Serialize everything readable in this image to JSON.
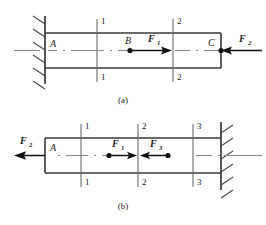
{
  "figure": {
    "colors": {
      "bar_edge": "#3a3a3a",
      "wall": "#3a3a3a",
      "hatch": "#4a4a4a",
      "section_line": "#6a6a6a",
      "center_line": "#8a8a8a",
      "force": "#111111",
      "text": "#1a1a1a",
      "background": "#ffffff"
    }
  },
  "diagrams": [
    {
      "id": "diagram-a",
      "caption": "(a)",
      "support_side": "left",
      "points": [
        {
          "name": "A",
          "label": "A"
        },
        {
          "name": "B",
          "label": "B"
        },
        {
          "name": "C",
          "label": "C"
        }
      ],
      "forces": [
        {
          "name": "F1",
          "base": "F",
          "sub": "1",
          "direction": "right",
          "applied_at": "B"
        },
        {
          "name": "F2",
          "base": "F",
          "sub": "2",
          "direction": "left",
          "applied_at": "C"
        }
      ],
      "sections": [
        {
          "label": "1",
          "top_label": "1",
          "bottom_label": "1"
        },
        {
          "label": "2",
          "top_label": "2",
          "bottom_label": "2"
        }
      ]
    },
    {
      "id": "diagram-b",
      "caption": "(b)",
      "support_side": "right",
      "points": [
        {
          "name": "A",
          "label": "A"
        }
      ],
      "forces": [
        {
          "name": "F2",
          "base": "F",
          "sub": "2",
          "direction": "left",
          "applied_at": "A"
        },
        {
          "name": "F1",
          "base": "F",
          "sub": "1",
          "direction": "right",
          "applied_at": "interior-left"
        },
        {
          "name": "F3",
          "base": "F",
          "sub": "3",
          "direction": "left",
          "applied_at": "interior-right"
        }
      ],
      "sections": [
        {
          "label": "1",
          "top_label": "1",
          "bottom_label": "1"
        },
        {
          "label": "2",
          "top_label": "2",
          "bottom_label": "2"
        },
        {
          "label": "3",
          "top_label": "3",
          "bottom_label": "3"
        }
      ]
    }
  ]
}
